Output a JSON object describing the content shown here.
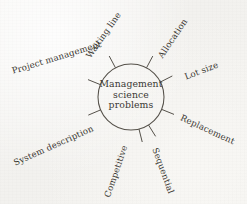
{
  "diagram": {
    "type": "radial-spoke",
    "title": "Management science problems",
    "hub": {
      "lines": [
        "Management",
        "science",
        "problems"
      ],
      "center_x": 131,
      "center_y": 97,
      "radius": 33,
      "stroke_color": "#55514a"
    },
    "background_color": "#f6f5f3",
    "text_color": "#38352f",
    "spokes": [
      {
        "label": "Waiting line",
        "angle_deg": -118,
        "label_rotation": -55,
        "label_x": 88,
        "label_y": 52
      },
      {
        "label": "Allocation",
        "angle_deg": -62,
        "label_rotation": -56,
        "label_x": 160,
        "label_y": 52
      },
      {
        "label": "Project management",
        "angle_deg": -158,
        "label_rotation": -17,
        "label_x": 12,
        "label_y": 66
      },
      {
        "label": "Lot size",
        "angle_deg": -27,
        "label_rotation": -21,
        "label_x": 185,
        "label_y": 72
      },
      {
        "label": "Replacement",
        "angle_deg": 22,
        "label_rotation": 25,
        "label_x": 181,
        "label_y": 112
      },
      {
        "label": "System description",
        "angle_deg": 157,
        "label_rotation": -24,
        "label_x": 14,
        "label_y": 158
      },
      {
        "label": "Competitive",
        "angle_deg": 76,
        "label_rotation": -71,
        "label_x": 107,
        "label_y": 192
      },
      {
        "label": "Sequential",
        "angle_deg": 58,
        "label_rotation": 70,
        "label_x": 155,
        "label_y": 143
      }
    ]
  }
}
